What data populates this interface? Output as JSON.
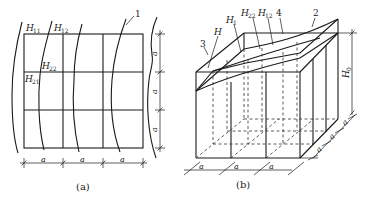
{
  "figure_a": {
    "caption": "(a)",
    "labels": {
      "H11": {
        "main": "H",
        "sub": "11"
      },
      "H12": {
        "main": "H",
        "sub": "12"
      },
      "H22": {
        "main": "H",
        "sub": "22"
      },
      "H21": {
        "main": "H",
        "sub": "21"
      },
      "callout_1": "1"
    },
    "dimension_label": "a",
    "grid": {
      "columns": 3,
      "rows": 3
    }
  },
  "figure_b": {
    "caption": "(b)",
    "labels": {
      "H": "H",
      "H1": {
        "main": "H",
        "sub": "1"
      },
      "H22": {
        "main": "H",
        "sub": "22"
      },
      "H12": {
        "main": "H",
        "sub": "12"
      },
      "H0": {
        "main": "H",
        "sub": "0"
      },
      "callout_2": "2",
      "callout_3": "3",
      "callout_4": "4"
    },
    "dimension_label": "a"
  }
}
